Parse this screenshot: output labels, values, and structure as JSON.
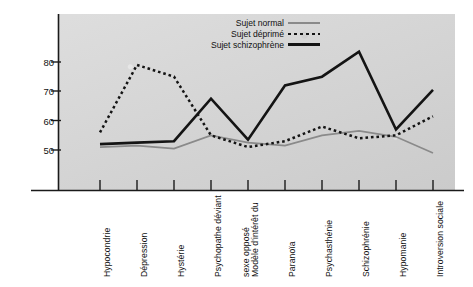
{
  "chart_data": {
    "type": "line",
    "title": "",
    "xlabel": "",
    "ylabel": "Résultat normal",
    "ylim": [
      44,
      88
    ],
    "yticks": [
      50,
      60,
      70,
      80
    ],
    "grid": false,
    "legend_position": "top-center",
    "categories": [
      "Hypocondrie",
      "Dépression",
      "Hystérie",
      "Psychopathe déviant",
      "Modèle d'intérêt du\nsexe opposé",
      "Paranoïa",
      "Psychasthénie",
      "Schizophrénie",
      "Hypomanie",
      "Introversion sociale"
    ],
    "series": [
      {
        "name": "Sujet normal",
        "style": "solid-thin",
        "color": "#8a8a8a",
        "values": [
          51,
          51.5,
          50.5,
          55,
          52.5,
          51.5,
          55,
          56.5,
          54.5,
          49
        ]
      },
      {
        "name": "Sujet déprimé",
        "style": "dotted",
        "color": "#141414",
        "values": [
          56,
          79,
          75,
          55,
          51,
          53,
          58,
          54,
          55,
          61.5
        ]
      },
      {
        "name": "Sujet schizophrène",
        "style": "solid-thick",
        "color": "#141414",
        "values": [
          52,
          52.5,
          53,
          67.5,
          53.5,
          72,
          75,
          83.5,
          57,
          70.5
        ]
      }
    ]
  },
  "legend": {
    "items": [
      {
        "label": "Sujet normal",
        "swatch": "solid-thin-gray-line"
      },
      {
        "label": "Sujet déprimé",
        "swatch": "dotted-black-line"
      },
      {
        "label": "Sujet schizophrène",
        "swatch": "solid-thick-black-line"
      }
    ]
  },
  "axes": {
    "y_title": "Résultat normal",
    "y_tick_labels": [
      "80",
      "70",
      "60",
      "50"
    ],
    "x_tick_labels": [
      "Hypocondrie",
      "Dépression",
      "Hystérie",
      "Psychopathe déviant",
      "Modèle d'intérêt du",
      "sexe opposé",
      "Paranoïa",
      "Psychasthénie",
      "Schizophrénie",
      "Hypomanie",
      "Introversion sociale"
    ]
  }
}
